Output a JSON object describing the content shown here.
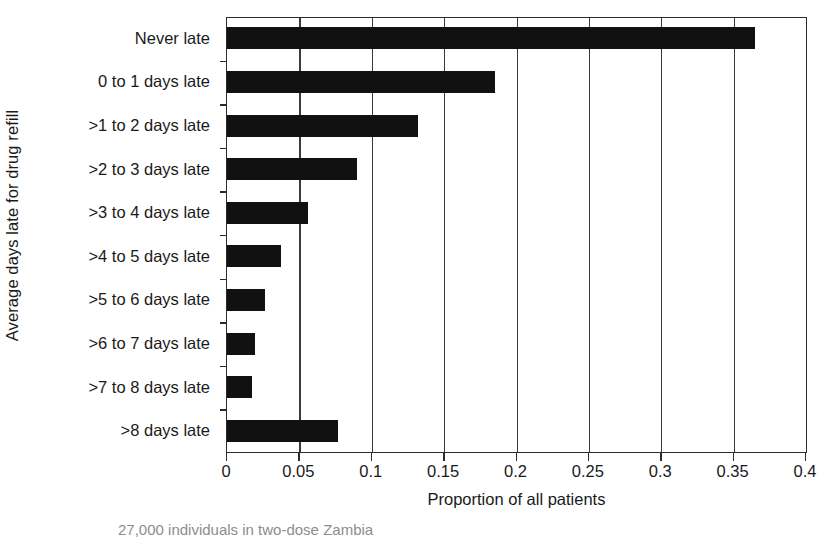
{
  "chart_data": {
    "type": "bar",
    "orientation": "horizontal",
    "title": "",
    "xlabel": "Proportion of all patients",
    "ylabel": "Average days late for drug refill",
    "xlim": [
      0,
      0.4
    ],
    "xticks": [
      "0",
      "0.05",
      "0.1",
      "0.15",
      "0.2",
      "0.25",
      "0.3",
      "0.35",
      "0.4"
    ],
    "xtick_values": [
      0,
      0.05,
      0.1,
      0.15,
      0.2,
      0.25,
      0.3,
      0.35,
      0.4
    ],
    "grid": "vertical",
    "legend": "none",
    "bar_color": "#111111",
    "categories": [
      "Never late",
      "0 to 1 days late",
      ">1 to 2 days late",
      ">2 to 3 days late",
      ">3 to 4 days late",
      ">4 to 5 days late",
      ">5 to 6 days late",
      ">6 to 7 days late",
      ">7 to 8 days late",
      ">8 days late"
    ],
    "values": [
      0.365,
      0.185,
      0.132,
      0.09,
      0.056,
      0.037,
      0.026,
      0.019,
      0.017,
      0.077
    ]
  },
  "caption": {
    "cut_off_line": "27,000 individuals in two-dose Zambia"
  }
}
